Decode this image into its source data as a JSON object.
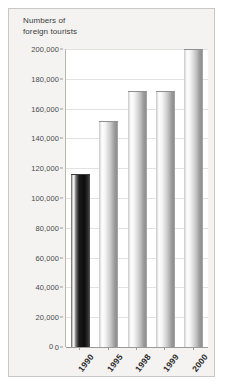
{
  "chart_data": {
    "type": "bar",
    "title": "Numbers of\nforeign tourists",
    "xlabel": "",
    "ylabel": "",
    "categories": [
      "1990",
      "1995",
      "1998",
      "1999",
      "2000"
    ],
    "values": [
      116000,
      152000,
      172000,
      172000,
      200000
    ],
    "ylim": [
      0,
      200000
    ],
    "ytick_labels": [
      "200,000",
      "180,000",
      "160,000",
      "140,000",
      "120,000",
      "100,000",
      "80,000",
      "60,000",
      "40,000",
      "20,000",
      "0"
    ],
    "ytick_values": [
      200000,
      180000,
      160000,
      140000,
      120000,
      100000,
      80000,
      60000,
      40000,
      20000,
      0
    ],
    "grid": true,
    "legend": "none",
    "bar_styles": [
      "dark",
      "silver",
      "silver",
      "silver",
      "silver"
    ],
    "colors": {
      "card_background": "#f4f3f1",
      "plot_background": "#ffffff",
      "gridline": "#e3e2df",
      "axis": "#9c9a96",
      "bar_silver_light": "#ffffff",
      "bar_silver_dark": "#8e8e8e",
      "bar_dark": "#0d0d0d",
      "text": "#3b3b3b",
      "border": "#c9c7c3"
    }
  }
}
